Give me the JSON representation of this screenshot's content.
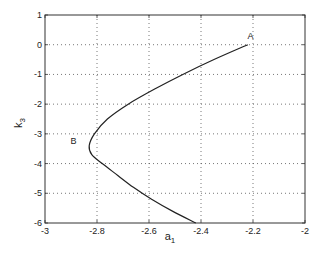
{
  "chart_data": {
    "type": "line",
    "title": "",
    "xlabel": "a_1",
    "ylabel": "k_3",
    "xlabel_main": "a",
    "xlabel_sub": "1",
    "ylabel_main": "k",
    "ylabel_sub": "3",
    "xlim": [
      -3,
      -2
    ],
    "ylim": [
      -6,
      1
    ],
    "grid": true,
    "legend": null,
    "xticks": [
      -3,
      -2.8,
      -2.6,
      -2.4,
      -2.2,
      -2
    ],
    "xtick_labels": [
      "-3",
      "-2.8",
      "-2.6",
      "-2.4",
      "-2.2",
      "-2"
    ],
    "yticks": [
      1,
      0,
      -1,
      -2,
      -3,
      -4,
      -5,
      -6
    ],
    "ytick_labels": [
      "1",
      "0",
      "-1",
      "-2",
      "-3",
      "-4",
      "-5",
      "-6"
    ],
    "series": [
      {
        "name": "curve",
        "x": [
          -2.22,
          -2.35,
          -2.47,
          -2.58,
          -2.68,
          -2.76,
          -2.81,
          -2.83,
          -2.82,
          -2.78,
          -2.72,
          -2.66,
          -2.59,
          -2.51,
          -2.42
        ],
        "y": [
          0,
          -0.5,
          -1,
          -1.5,
          -2,
          -2.5,
          -3,
          -3.4,
          -3.7,
          -4,
          -4.4,
          -4.8,
          -5.2,
          -5.6,
          -6
        ]
      }
    ],
    "annotations": [
      {
        "text": "A",
        "x": -2.21,
        "y": 0.2
      },
      {
        "text": "B",
        "x": -2.89,
        "y": -3.35
      }
    ]
  }
}
